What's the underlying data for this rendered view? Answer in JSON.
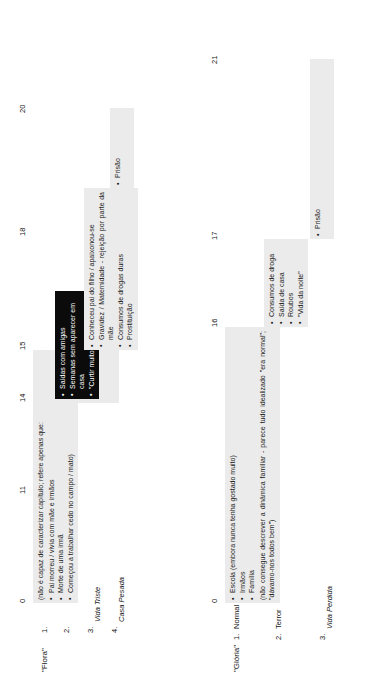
{
  "document": {
    "type": "life-timeline-diagram",
    "cases": [
      {
        "name": "\"Flora\"",
        "axis_ticks": [
          "0",
          "11",
          "14",
          "15",
          "18",
          "20"
        ],
        "phases": [
          {
            "num": "1.",
            "label": ""
          },
          {
            "num": "2.",
            "label": ""
          },
          {
            "num": "3.",
            "label": "Vida Triste"
          },
          {
            "num": "4.",
            "label": "Casa Pesada"
          }
        ],
        "boxes": [
          {
            "id": "flora-box-1",
            "style": "light",
            "lead": "(não é capaz de caracterizar capítulo; refere apenas que:",
            "items": [
              "Pai morreu / vivia com mãe e irmãos",
              "Morte de uma irmã",
              "Começou a trabalhar cedo no campo / mato)"
            ],
            "tail": ""
          },
          {
            "id": "flora-box-2",
            "style": "dark",
            "lead": "",
            "items": [
              "Saídas com amigas",
              "Semanas sem aparecer em casa",
              "\"Curtir muito\""
            ],
            "tail": ""
          },
          {
            "id": "flora-box-3",
            "style": "light",
            "lead": "",
            "items": [
              "Conheceu pai do filho / apaixonou-se",
              "Gravidez / Maternidade - rejeição por parte da mãe",
              "Consumos de drogas duras",
              "Prostituição"
            ],
            "tail": ""
          },
          {
            "id": "flora-box-4",
            "style": "light",
            "lead": "",
            "items": [
              "Prisão"
            ],
            "tail": ""
          }
        ]
      },
      {
        "name": "\"Glória\"",
        "axis_ticks": [
          "0",
          "16",
          "17",
          "21"
        ],
        "phases": [
          {
            "num": "1.",
            "label": "Normal"
          },
          {
            "num": "2.",
            "label": "Terror"
          },
          {
            "num": "3.",
            "label": "Vida Perdida"
          }
        ],
        "boxes": [
          {
            "id": "gloria-box-1",
            "style": "light",
            "lead": "",
            "items": [
              "Escola (embora nunca tenha gostado muito)",
              "Irmãos",
              "Família"
            ],
            "tail": "(não consegue descrever a dinâmica familiar - parece tudo idealizado \"era normal\"; \"dávamo-nos todos bem\")"
          },
          {
            "id": "gloria-box-2",
            "style": "light",
            "lead": "",
            "items": [
              "Consumos de droga",
              "Saída de casa",
              "Roubos",
              "\"Vida da noite\""
            ],
            "tail": ""
          },
          {
            "id": "gloria-box-3",
            "style": "light",
            "lead": "",
            "items": [
              "Prisão"
            ],
            "tail": ""
          }
        ]
      }
    ]
  }
}
